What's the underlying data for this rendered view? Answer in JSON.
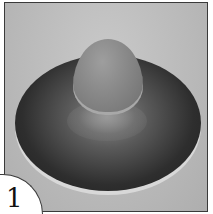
{
  "figure": {
    "number": "1",
    "colors": {
      "background": "#b9b9b9",
      "disc": "#2e2e2e",
      "dome": "#8a8a8a",
      "border": "#3a3a3a"
    }
  }
}
